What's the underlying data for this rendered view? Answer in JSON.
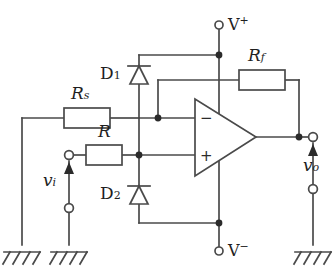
{
  "figure": {
    "type": "schematic",
    "background_color": "#ffffff",
    "wire_color": "#4a4a4a",
    "text_color": "#1f1f1f"
  },
  "labels": {
    "source_resistor": {
      "base": "R",
      "sub": "s"
    },
    "input_resistor": {
      "base": "R",
      "sub": ""
    },
    "feedback_resistor": {
      "base": "R",
      "sub": "f"
    },
    "diode_top": {
      "base": "D",
      "sub": "1"
    },
    "diode_bottom": {
      "base": "D",
      "sub": "2"
    },
    "input_voltage": {
      "base": "v",
      "sub": "i"
    },
    "output_voltage": {
      "base": "v",
      "sub": "o"
    },
    "supply_positive": {
      "base": "V",
      "sup": "+"
    },
    "supply_negative": {
      "base": "V",
      "sup": "−"
    },
    "opamp_inverting": "−",
    "opamp_noninverting": "+"
  },
  "components": {
    "resistors": [
      {
        "name": "Rs",
        "label": "R",
        "subscript": "s",
        "orientation": "horizontal"
      },
      {
        "name": "R",
        "label": "R",
        "subscript": "",
        "orientation": "horizontal"
      },
      {
        "name": "Rf",
        "label": "R",
        "subscript": "f",
        "orientation": "horizontal"
      }
    ],
    "diodes": [
      {
        "name": "D1",
        "label": "D",
        "subscript": "1",
        "orientation": "vertical",
        "direction": "up"
      },
      {
        "name": "D2",
        "label": "D",
        "subscript": "2",
        "orientation": "vertical",
        "direction": "up"
      }
    ],
    "opamp": {
      "name": "U1",
      "inverting_input": "−",
      "noninverting_input": "+"
    },
    "grounds": [
      {
        "name": "ground-left"
      },
      {
        "name": "ground-input"
      },
      {
        "name": "ground-output"
      }
    ],
    "terminals": [
      {
        "name": "vplus-terminal",
        "label": "V+"
      },
      {
        "name": "vminus-terminal",
        "label": "V−"
      },
      {
        "name": "vi-top-terminal",
        "label": ""
      },
      {
        "name": "vi-bottom-terminal",
        "label": ""
      },
      {
        "name": "vo-top-terminal",
        "label": ""
      },
      {
        "name": "vo-bottom-terminal",
        "label": ""
      }
    ]
  }
}
